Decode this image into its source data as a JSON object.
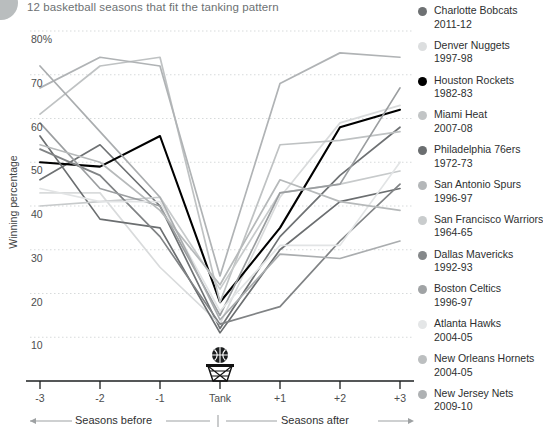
{
  "title": "12 basketball seasons that fit the tanking pattern",
  "chart_data": {
    "type": "line",
    "title": "12 basketball seasons that fit the tanking pattern",
    "xlabel": "",
    "ylabel": "Winning percentage",
    "grid": true,
    "legend_position": "right",
    "categories": [
      "-3",
      "-2",
      "-1",
      "Tank",
      "+1",
      "+2",
      "+3"
    ],
    "x_tick_labels": [
      "-3",
      "-2",
      "-1",
      "Tank",
      "+1",
      "+2",
      "+3"
    ],
    "y_tick_labels": [
      "80%",
      "70",
      "60",
      "50",
      "40",
      "30",
      "20",
      "10"
    ],
    "y_tick_values": [
      80,
      70,
      60,
      50,
      40,
      30,
      20,
      10
    ],
    "ylim": [
      5,
      82
    ],
    "axis_annotations": {
      "before": "Seasons before",
      "after": "Seasons after",
      "tank_marker": "Tank"
    },
    "series": [
      {
        "name": "Charlotte Bobcats",
        "season": "2011-12",
        "color": "#6e7173",
        "values": [
          46,
          54,
          40,
          12,
          33,
          47,
          58
        ]
      },
      {
        "name": "Denver Nuggets",
        "season": "1997-98",
        "color": "#d9dbdc",
        "values": [
          43,
          43,
          26,
          13,
          42,
          59,
          63
        ]
      },
      {
        "name": "Houston Rockets",
        "season": "1982-83",
        "color": "#000000",
        "values": [
          50,
          49,
          56,
          18,
          35,
          58,
          62
        ]
      },
      {
        "name": "Miami Heat",
        "season": "2007-08",
        "color": "#bfc2c3",
        "values": [
          61,
          72,
          74,
          18,
          54,
          55,
          57
        ]
      },
      {
        "name": "Philadelphia 76ers",
        "season": "1972-73",
        "color": "#6b6e70",
        "values": [
          56,
          37,
          35,
          11,
          30,
          41,
          44
        ]
      },
      {
        "name": "San Antonio Spurs",
        "season": "1996-97",
        "color": "#b0b3b5",
        "values": [
          67,
          74,
          72,
          24,
          68,
          75,
          74
        ]
      },
      {
        "name": "San Francisco Warriors",
        "season": "1964-65",
        "color": "#c7cacb",
        "values": [
          40,
          41,
          42,
          21,
          43,
          45,
          48
        ]
      },
      {
        "name": "Dallas Mavericks",
        "season": "1992-93",
        "color": "#808385",
        "values": [
          53,
          47,
          33,
          13,
          17,
          32,
          45
        ]
      },
      {
        "name": "Boston Celtics",
        "season": "1996-97",
        "color": "#9b9ea0",
        "values": [
          59,
          44,
          40,
          15,
          43,
          45,
          67
        ]
      },
      {
        "name": "Atlanta Hawks",
        "season": "2004-05",
        "color": "#e2e4e5",
        "values": [
          44,
          41,
          41,
          16,
          31,
          31,
          50
        ]
      },
      {
        "name": "New Orleans Hornets",
        "season": "2004-05",
        "color": "#b6b9ba",
        "values": [
          54,
          50,
          39,
          22,
          46,
          41,
          39
        ]
      },
      {
        "name": "New Jersey Nets",
        "season": "2009-10",
        "color": "#aaadaf",
        "values": [
          72,
          57,
          42,
          14,
          29,
          28,
          32
        ]
      }
    ]
  },
  "legend": {
    "items": [
      {
        "team": "Charlotte Bobcats",
        "season": "2011-12",
        "color": "#6e7173"
      },
      {
        "team": "Denver Nuggets",
        "season": "1997-98",
        "color": "#dcdedf"
      },
      {
        "team": "Houston Rockets",
        "season": "1982-83",
        "color": "#000000"
      },
      {
        "team": "Miami Heat",
        "season": "2007-08",
        "color": "#c2c5c6"
      },
      {
        "team": "Philadelphia 76ers",
        "season": "1972-73",
        "color": "#6b6e70"
      },
      {
        "team": "San Antonio Spurs",
        "season": "1996-97",
        "color": "#b4b7b9"
      },
      {
        "team": "San Francisco Warriors",
        "season": "1964-65",
        "color": "#c9cccd"
      },
      {
        "team": "Dallas Mavericks",
        "season": "1992-93",
        "color": "#85888a"
      },
      {
        "team": "Boston Celtics",
        "season": "1996-97",
        "color": "#a0a3a5"
      },
      {
        "team": "Atlanta Hawks",
        "season": "2004-05",
        "color": "#e4e6e7"
      },
      {
        "team": "New Orleans Hornets",
        "season": "2004-05",
        "color": "#bcbfc0"
      },
      {
        "team": "New Jersey Nets",
        "season": "2009-10",
        "color": "#aeb1b3"
      }
    ]
  },
  "icons": {
    "basketball": "basketball-icon",
    "hoop": "basketball-hoop-icon"
  }
}
